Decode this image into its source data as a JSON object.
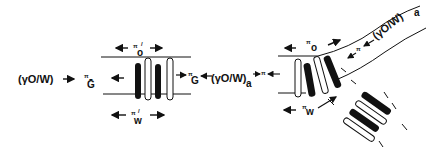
{
  "diagram": {
    "left_panel": {
      "left_label": "(γO/W)",
      "pi_G_left": "π",
      "G_left": "Ḡ",
      "pi_o_prime": "π",
      "o_sub": "o",
      "prime": "/",
      "pi_w_prime": "π",
      "w_sub": "w",
      "pi_G_right": "π",
      "G_right": "G"
    },
    "center_label": {
      "gamma": "(γO/W)",
      "sub_a": "a",
      "pi": "π"
    },
    "right_panel": {
      "pi_o": "π",
      "o_sub": "o",
      "pi_w": "π",
      "w_sub": "w",
      "curved_label": "(γO/W)",
      "curved_sub": "a",
      "curved_pi": "π"
    }
  }
}
